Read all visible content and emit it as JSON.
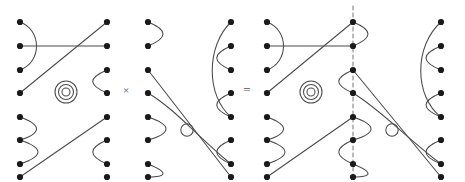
{
  "figure": {
    "background_color": "#ffffff",
    "stroke_color": "#4a4a4a",
    "node_color": "#1a1a1a",
    "dashed_color": "#777777",
    "width": 465,
    "height": 182
  },
  "operators": {
    "multiply": "×",
    "equals": "="
  },
  "geometry": {
    "node_radius": 3.1,
    "open_circle_radius": 6.2,
    "dot_rows_y": [
      22,
      46,
      70,
      93,
      117,
      140,
      164,
      22
    ],
    "row_y": [
      22,
      46,
      70,
      93,
      117,
      140,
      164
    ],
    "stroke_width": 1.05
  },
  "panels": [
    {
      "id": "factor-left",
      "label": "left factor diagram",
      "left_column_x": 20,
      "right_column_x": 107,
      "left_nodes_y": [
        22,
        46,
        70,
        93,
        117,
        140,
        164,
        177
      ],
      "right_nodes_y": [
        22,
        46,
        70,
        93,
        117,
        140,
        164,
        177
      ],
      "loop_center": {
        "x": 66,
        "y": 92
      },
      "loop_rings": 3,
      "loop_radii": [
        4,
        7.5,
        11
      ],
      "open_circle": null
    },
    {
      "id": "factor-right",
      "label": "right factor diagram",
      "left_column_x": 148,
      "right_column_x": 231,
      "left_nodes_y": [
        22,
        46,
        70,
        93,
        117,
        140,
        164,
        177
      ],
      "right_nodes_y": [
        22,
        46,
        70,
        93,
        117,
        140,
        164,
        177
      ],
      "loop_center": null,
      "loop_rings": 0,
      "open_circle": {
        "x": 187,
        "y": 130,
        "r": 6.2
      }
    },
    {
      "id": "product",
      "label": "product diagram with dashed seam",
      "left_column_x": 267,
      "middle_column_x": 353,
      "right_column_x": 441,
      "left_nodes_y": [
        22,
        46,
        70,
        93,
        117,
        140,
        164,
        177
      ],
      "middle_nodes_y": [
        22,
        46,
        70,
        93,
        117,
        140,
        164,
        177
      ],
      "right_nodes_y": [
        22,
        46,
        70,
        93,
        117,
        140,
        164,
        177
      ],
      "loop_center": {
        "x": 311,
        "y": 92
      },
      "loop_rings": 3,
      "loop_radii": [
        4,
        7.5,
        11
      ],
      "open_circle": {
        "x": 392,
        "y": 130,
        "r": 6.2
      },
      "seam": {
        "x": 353,
        "y1": 6,
        "y2": 176,
        "dash": "4 3"
      }
    }
  ],
  "annotations": {
    "description": "Two planar tangle diagrams multiplied together equal a stacked diagram; closed loops contribute scalar factors.",
    "closed_loop_count_left": 3,
    "closed_loop_count_product": 3,
    "empty_loop_right": 1,
    "empty_loop_product": 1
  }
}
